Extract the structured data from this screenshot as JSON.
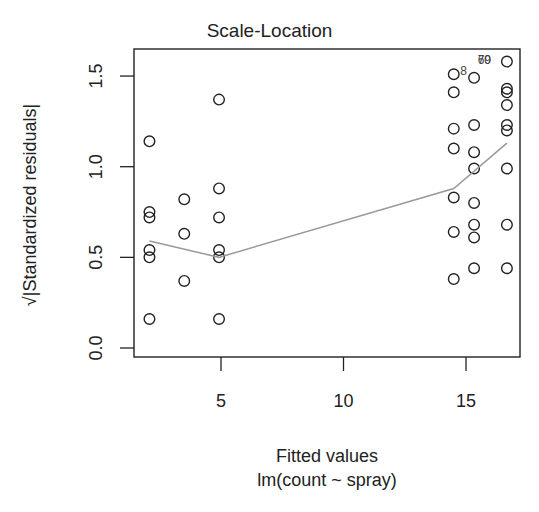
{
  "chart_data": {
    "type": "scatter",
    "title": "Scale-Location",
    "xlabel": "Fitted values",
    "subtitle": "lm(count ~ spray)",
    "ylabel": "√|Standardized residuals|",
    "xlim": [
      1.5,
      17.2
    ],
    "ylim": [
      0.0,
      1.6
    ],
    "x_ticks": [
      5,
      10,
      15
    ],
    "y_ticks": [
      0.0,
      0.5,
      1.0,
      1.5
    ],
    "y_tick_labels": [
      "0.0",
      "0.5",
      "1.0",
      "1.5"
    ],
    "x_tick_labels": [
      "5",
      "10",
      "15"
    ],
    "grid": false,
    "points": {
      "x": [
        2.08,
        2.08,
        2.08,
        2.08,
        2.08,
        2.08,
        3.5,
        3.5,
        3.5,
        4.92,
        4.92,
        4.92,
        4.92,
        4.92,
        4.92,
        14.5,
        14.5,
        14.5,
        14.5,
        14.5,
        14.5,
        14.5,
        15.33,
        15.33,
        15.33,
        15.33,
        15.33,
        15.33,
        15.33,
        15.33,
        16.67,
        16.67,
        16.67,
        16.67,
        16.67,
        16.67,
        16.67,
        16.67,
        16.67
      ],
      "y": [
        1.14,
        0.75,
        0.72,
        0.54,
        0.5,
        0.16,
        0.82,
        0.63,
        0.37,
        1.37,
        0.88,
        0.72,
        0.54,
        0.5,
        0.16,
        1.51,
        1.41,
        1.21,
        1.1,
        0.83,
        0.64,
        0.38,
        1.49,
        1.23,
        1.08,
        0.99,
        0.8,
        0.68,
        0.61,
        0.44,
        1.58,
        1.43,
        1.41,
        1.34,
        1.23,
        1.2,
        0.99,
        0.68,
        0.44
      ]
    },
    "smoother": {
      "x": [
        2.08,
        4.92,
        14.5,
        16.67
      ],
      "y": [
        0.59,
        0.5,
        0.88,
        1.13
      ],
      "color": "#999999"
    },
    "point_labels": [
      {
        "label": "8",
        "x": 14.9,
        "y": 1.53
      },
      {
        "label": "70",
        "x": 15.75,
        "y": 1.59
      },
      {
        "label": "69",
        "x": 15.75,
        "y": 1.59
      }
    ]
  },
  "colors": {
    "axis": "#222222",
    "points": "#222222",
    "smoother": "#999999",
    "background": "#ffffff"
  }
}
